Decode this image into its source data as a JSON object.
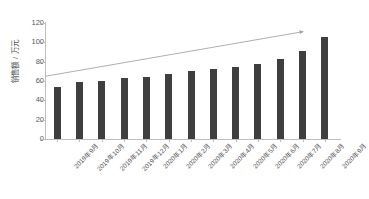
{
  "chart_data": {
    "type": "bar",
    "title": "",
    "subtitle": "",
    "xlabel": "",
    "ylabel": "销售额 / 万元",
    "ylim": [
      0,
      120
    ],
    "yticks": [
      0,
      20,
      40,
      60,
      80,
      100,
      120
    ],
    "grid": false,
    "legend": "none",
    "bar_color": "#3f3f3f",
    "trendline_color": "#a6a6a6",
    "axis_color": "#bfbfbf",
    "categories": [
      "2019年9月",
      "2019年10月",
      "2019年11月",
      "2019年12月",
      "2020年1月",
      "2020年2月",
      "2020年3月",
      "2020年4月",
      "2020年5月",
      "2020年6月",
      "2020年7月",
      "2020年8月",
      "2020年9月"
    ],
    "values": [
      54,
      59,
      60,
      63,
      64,
      67,
      70,
      72,
      75,
      78,
      83,
      91,
      106
    ],
    "annotations": [
      {
        "type": "trend-arrow",
        "start_value": 65,
        "end_value": 111,
        "direction": "up-right",
        "style": "thin-line-with-arrowhead"
      }
    ]
  }
}
